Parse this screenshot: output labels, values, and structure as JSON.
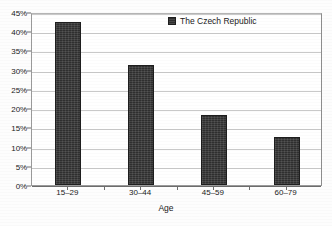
{
  "chart_data": {
    "type": "bar",
    "title": "",
    "subtitle": "",
    "xlabel": "Age",
    "ylabel": "",
    "categories": [
      "15–29",
      "30–44",
      "45–59",
      "60–79"
    ],
    "values": [
      42.5,
      31.3,
      18.2,
      12.5
    ],
    "series": [
      {
        "name": "The Czech Republic",
        "values": [
          42.5,
          31.3,
          18.2,
          12.5
        ],
        "color": "#2f2f2f"
      }
    ],
    "ylim": [
      0,
      45
    ],
    "ytick_values": [
      0,
      5,
      10,
      15,
      20,
      25,
      30,
      35,
      40,
      45
    ],
    "ytick_labels": [
      "0%",
      "5%",
      "10%",
      "15%",
      "20%",
      "25%",
      "30%",
      "35%",
      "40%",
      "45%"
    ],
    "xtick_labels": [
      "15–29",
      "30–44",
      "45–59",
      "60–79"
    ],
    "grid": true,
    "grid_axis": "y",
    "legend": {
      "position": "top-right-inside",
      "entries": [
        {
          "label": "The Czech Republic",
          "marker": "legend-square-marker",
          "color": "#2f2f2f"
        }
      ]
    },
    "axis_line_color": "#6d6d6d",
    "grid_color": "#c9c9c9",
    "background_color": "#ffffff"
  }
}
